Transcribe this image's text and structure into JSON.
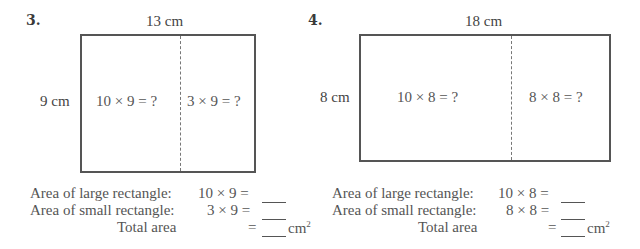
{
  "problems": [
    {
      "number": "3.",
      "width_label": "13 cm",
      "height_label": "9 cm",
      "left_expr": "10 × 9 = ?",
      "right_expr": "3 × 9 = ?",
      "large_label": "Area of large rectangle:",
      "large_expr": "10 × 9 =",
      "small_label": "Area of small rectangle:",
      "small_expr": "3 × 9 =",
      "total_label": "Total area",
      "total_eq": "=",
      "unit": "cm",
      "unit_exp": "2"
    },
    {
      "number": "4.",
      "width_label": "18 cm",
      "height_label": "8 cm",
      "left_expr": "10 × 8 = ?",
      "right_expr": "8 × 8 = ?",
      "large_label": "Area of large rectangle:",
      "large_expr": "10 × 8 =",
      "small_label": "Area of small rectangle:",
      "small_expr": "8 × 8 =",
      "total_label": "Total area",
      "total_eq": "=",
      "unit": "cm",
      "unit_exp": "2"
    }
  ]
}
